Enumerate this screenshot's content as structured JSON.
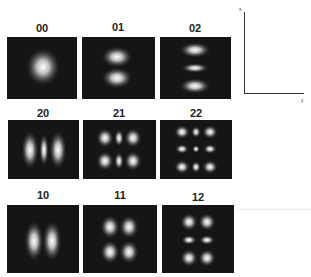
{
  "figure": {
    "modes": [
      {
        "label": "00",
        "m": 0,
        "n": 0,
        "row": 0,
        "col": 0
      },
      {
        "label": "01",
        "m": 0,
        "n": 1,
        "row": 0,
        "col": 1
      },
      {
        "label": "02",
        "m": 0,
        "n": 2,
        "row": 0,
        "col": 2
      },
      {
        "label": "20",
        "m": 2,
        "n": 0,
        "row": 1,
        "col": 0
      },
      {
        "label": "21",
        "m": 2,
        "n": 1,
        "row": 1,
        "col": 1
      },
      {
        "label": "22",
        "m": 2,
        "n": 2,
        "row": 1,
        "col": 2
      },
      {
        "label": "10",
        "m": 1,
        "n": 0,
        "row": 2,
        "col": 0
      },
      {
        "label": "11",
        "m": 1,
        "n": 1,
        "row": 2,
        "col": 1
      },
      {
        "label": "12",
        "m": 1,
        "n": 2,
        "row": 2,
        "col": 2
      }
    ],
    "axes": {
      "vertical_label": "x",
      "horizontal_label": "y"
    },
    "colors": {
      "background": "#151515",
      "spot": "#ffffff",
      "text": "#222222"
    }
  }
}
